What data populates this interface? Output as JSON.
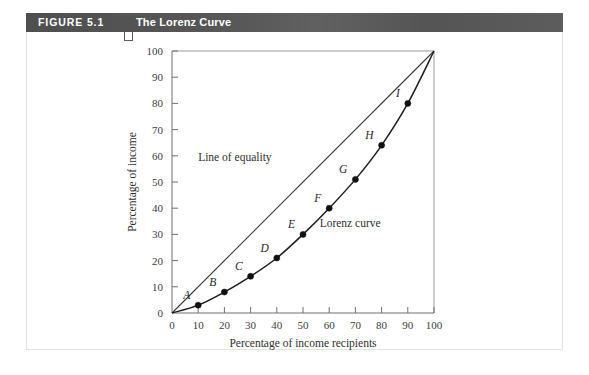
{
  "figure": {
    "number_label": "FIGURE 5.1",
    "title": "The Lorenz Curve"
  },
  "chart_data": {
    "type": "line",
    "title": "The Lorenz Curve",
    "xlabel": "Percentage of income recipients",
    "ylabel": "Percentage of income",
    "xlim": [
      0,
      100
    ],
    "ylim": [
      0,
      100
    ],
    "xticks": [
      "0",
      "10",
      "20",
      "30",
      "40",
      "50",
      "60",
      "70",
      "80",
      "90",
      "100"
    ],
    "yticks": [
      "0",
      "10",
      "20",
      "30",
      "40",
      "50",
      "60",
      "70",
      "80",
      "90",
      "100"
    ],
    "grid": false,
    "legend": "none",
    "series": [
      {
        "name": "Line of equality",
        "annotation": "Line of equality",
        "x": [
          0,
          100
        ],
        "values": [
          0,
          100
        ]
      },
      {
        "name": "Lorenz curve",
        "annotation": "Lorenz curve",
        "x": [
          0,
          10,
          20,
          30,
          40,
          50,
          60,
          70,
          80,
          90,
          100
        ],
        "values": [
          0,
          3,
          8,
          14,
          21,
          30,
          40,
          51,
          64,
          80,
          100
        ]
      }
    ],
    "points": [
      {
        "label": "A",
        "x": 10,
        "y": 3
      },
      {
        "label": "B",
        "x": 20,
        "y": 8
      },
      {
        "label": "C",
        "x": 30,
        "y": 14
      },
      {
        "label": "D",
        "x": 40,
        "y": 21
      },
      {
        "label": "E",
        "x": 50,
        "y": 30
      },
      {
        "label": "F",
        "x": 60,
        "y": 40
      },
      {
        "label": "G",
        "x": 70,
        "y": 51
      },
      {
        "label": "H",
        "x": 80,
        "y": 64
      },
      {
        "label": "I",
        "x": 90,
        "y": 80
      }
    ],
    "annotations": [
      {
        "text": "Line of equality",
        "x": 24,
        "y": 58
      },
      {
        "text": "Lorenz curve",
        "x": 68,
        "y": 33
      }
    ]
  },
  "colors": {
    "header_bar": "#4f4f4f",
    "header_text": "#ffffff",
    "axis": "#6f6f6f",
    "curve": "#1c1c1c",
    "panel_border": "#e3e3e3"
  }
}
